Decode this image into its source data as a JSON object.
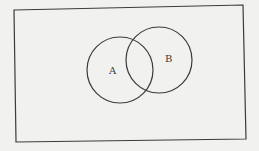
{
  "diagram": {
    "type": "venn",
    "universe": {
      "corners": [
        [
          14,
          10
        ],
        [
          243,
          5
        ],
        [
          246,
          139
        ],
        [
          16,
          142
        ]
      ],
      "stroke": "#3b3b3b"
    },
    "sets": [
      {
        "label": "A",
        "cx": 120,
        "cy": 70,
        "r": 33,
        "label_x": 112,
        "label_y": 74
      },
      {
        "label": "B",
        "cx": 159,
        "cy": 60,
        "r": 33,
        "label_x": 168,
        "label_y": 62
      }
    ],
    "stroke_color": "#3b3b3b",
    "background": "#f1f1ef"
  }
}
